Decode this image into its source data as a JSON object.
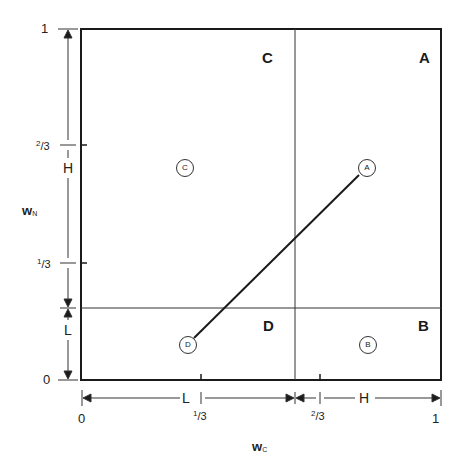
{
  "diagram": {
    "x_axis": {
      "name": "w",
      "subscript": "C",
      "ticks": [
        "0",
        "1/3",
        "2/3",
        "1"
      ]
    },
    "y_axis": {
      "name": "w",
      "subscript": "N",
      "ticks": [
        "0",
        "1/3",
        "2/3",
        "1"
      ]
    },
    "quadrant_labels": {
      "C": "C",
      "A": "A",
      "D": "D",
      "B": "B"
    },
    "points": [
      {
        "id": "C",
        "label": "C"
      },
      {
        "id": "A",
        "label": "A"
      },
      {
        "id": "D",
        "label": "D"
      },
      {
        "id": "B",
        "label": "B"
      }
    ],
    "connecting_line": {
      "from": "D",
      "to": "A"
    },
    "x_dimensions": {
      "low": "L",
      "high": "H"
    },
    "y_dimensions": {
      "low": "L",
      "high": "H"
    },
    "frac_parts": {
      "one_third": {
        "num": "1",
        "den": "3"
      },
      "two_thirds": {
        "num": "2",
        "den": "3"
      }
    }
  }
}
